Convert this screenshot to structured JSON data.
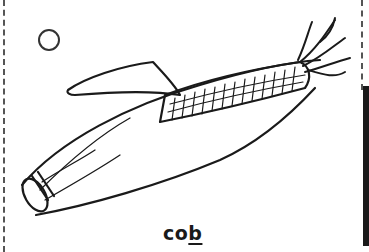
{
  "card": {
    "word_prefix": "co",
    "word_underlined": "b",
    "illustration": "corn-cob-icon",
    "checkbox": "circle-icon",
    "colors": {
      "ink": "#1a1a1a",
      "background": "#ffffff"
    }
  }
}
